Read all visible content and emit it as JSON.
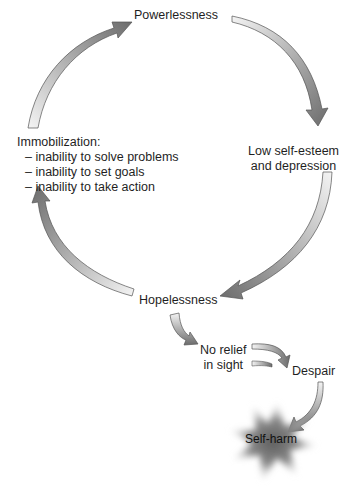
{
  "nodes": {
    "powerlessness": "Powerlessness",
    "low_self_esteem": [
      "Low self-esteem",
      "and depression"
    ],
    "hopelessness": "Hopelessness",
    "immobilization": {
      "heading": "Immobilization:",
      "items": [
        "– inability to solve problems",
        "– inability to set goals",
        "– inability to take action"
      ]
    },
    "no_relief": [
      "No relief",
      "in sight"
    ],
    "despair": "Despair",
    "self_harm": "Self-harm"
  },
  "edges": [
    {
      "from": "Powerlessness",
      "to": "Low self-esteem and depression"
    },
    {
      "from": "Low self-esteem and depression",
      "to": "Hopelessness"
    },
    {
      "from": "Hopelessness",
      "to": "Immobilization"
    },
    {
      "from": "Immobilization",
      "to": "Powerlessness"
    },
    {
      "from": "Hopelessness",
      "to": "No relief in sight"
    },
    {
      "from": "No relief in sight",
      "to": "Despair"
    },
    {
      "from": "Despair",
      "to": "Self-harm"
    }
  ],
  "colors": {
    "arrow_dark": "#6e6e6e",
    "arrow_light": "#f2f2f2",
    "outline": "#555555",
    "star_core": "#6a6a6a"
  }
}
